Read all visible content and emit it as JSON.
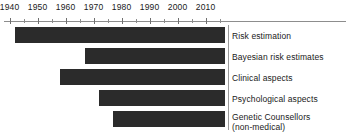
{
  "chart_data": {
    "type": "bar",
    "orientation": "horizontal",
    "subtype": "timeline-gantt",
    "title": "",
    "subtitle": "",
    "xlabel": "",
    "ylabel": "",
    "xlim": [
      1938,
      2018
    ],
    "grid": false,
    "legend": null,
    "axis": {
      "tick_labels": [
        "1940",
        "1950",
        "1960",
        "1970",
        "1980",
        "1990",
        "2000",
        "2010"
      ],
      "tick_values": [
        1940,
        1950,
        1960,
        1970,
        1980,
        1990,
        2000,
        2010
      ],
      "minor_tick_values": [
        1945,
        1955,
        1965,
        1975,
        1985,
        1995,
        2005,
        2015
      ],
      "tick_interval": 10,
      "minor_tick_interval": 5,
      "position": "top"
    },
    "categories": [
      "Risk estimation",
      "Bayesian risk estimates",
      "Clinical aspects",
      "Psychological aspects",
      "Genetic Counsellors (non-medical)"
    ],
    "bar_color": "#2b2b2b",
    "bars": [
      {
        "label": "Risk estimation",
        "label_line1": "Risk estimation",
        "label_line2": "",
        "start": 1942,
        "end": 2017
      },
      {
        "label": "Bayesian risk estimates",
        "label_line1": "Bayesian risk estimates",
        "label_line2": "",
        "start": 1967,
        "end": 2017
      },
      {
        "label": "Clinical aspects",
        "label_line1": "Clinical aspects",
        "label_line2": "",
        "start": 1958,
        "end": 2017
      },
      {
        "label": "Psychological aspects",
        "label_line1": "Psychological aspects",
        "label_line2": "",
        "start": 1972,
        "end": 2017
      },
      {
        "label": "Genetic Counsellors (non-medical)",
        "label_line1": "Genetic Counsellors",
        "label_line2": "(non-medical)",
        "start": 1977,
        "end": 2017
      }
    ]
  },
  "colors": {
    "bar": "#2b2b2b",
    "axis": "#8d8d8d",
    "tick": "#6f6f6f",
    "text": "#1a1a1a",
    "background": "#ffffff"
  }
}
